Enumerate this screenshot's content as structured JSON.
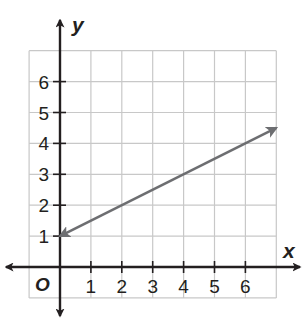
{
  "chart_data": {
    "type": "line",
    "title": "",
    "xlabel": "x",
    "ylabel": "y",
    "origin_label": "O",
    "xlim": [
      -1,
      7
    ],
    "ylim": [
      -1,
      7
    ],
    "grid": true,
    "x_ticks": [
      "1",
      "2",
      "3",
      "4",
      "5",
      "6"
    ],
    "y_ticks": [
      "1",
      "2",
      "3",
      "4",
      "5",
      "6"
    ],
    "series": [
      {
        "name": "line",
        "equation": "y = 0.5x + 1",
        "x": [
          0,
          7
        ],
        "y": [
          1,
          4.5
        ],
        "arrows": "both",
        "color": "#6d6e71"
      }
    ],
    "axis_color": "#231f20",
    "grid_color": "#c8c8c8"
  }
}
